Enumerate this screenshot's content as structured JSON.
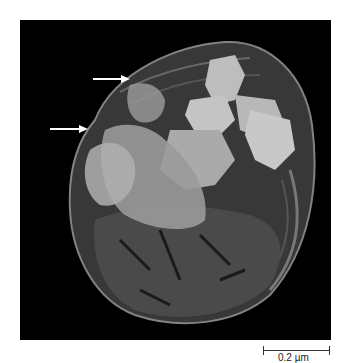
{
  "figure": {
    "background_color": "#000000",
    "arrows": [
      {
        "name": "upper-arrow",
        "x1": 93,
        "y1": 79,
        "x2": 127,
        "y2": 79,
        "color": "#ffffff"
      },
      {
        "name": "lower-arrow",
        "x1": 50,
        "y1": 129,
        "x2": 88,
        "y2": 129,
        "color": "#ffffff"
      }
    ],
    "scale_bar": {
      "label": "0.2 µm",
      "length_px": 67
    }
  }
}
